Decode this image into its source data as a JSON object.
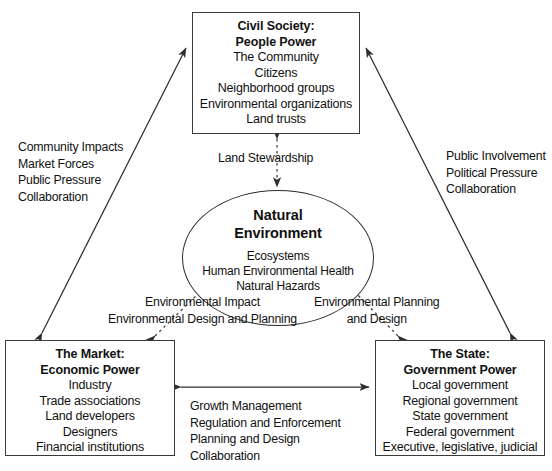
{
  "diagram": {
    "type": "relationship-triangle",
    "nodes": {
      "civil_society": {
        "title_line1": "Civil Society:",
        "title_line2": "People Power",
        "items": [
          "The Community",
          "Citizens",
          "Neighborhood groups",
          "Environmental organizations",
          "Land trusts"
        ]
      },
      "market": {
        "title_line1": "The Market:",
        "title_line2": "Economic Power",
        "items": [
          "Industry",
          "Trade associations",
          "Land developers",
          "Designers",
          "Financial institutions"
        ]
      },
      "state": {
        "title_line1": "The State:",
        "title_line2": "Government Power",
        "items": [
          "Local government",
          "Regional government",
          "State government",
          "Federal government",
          "Executive, legislative, judicial"
        ]
      },
      "natural_environment": {
        "title_line1": "Natural",
        "title_line2": "Environment",
        "items": [
          "Ecosystems",
          "Human Environmental Health",
          "Natural Hazards"
        ]
      }
    },
    "edge_labels": {
      "market_to_civil_society": [
        "Community Impacts",
        "Market Forces",
        "Public Pressure",
        "Collaboration"
      ],
      "state_to_civil_society": [
        "Public Involvement",
        "Political Pressure",
        "Collaboration"
      ],
      "civil_society_to_environment": [
        "Land Stewardship"
      ],
      "market_to_environment": [
        "Environmental Impact",
        "Environmental Design and Planning"
      ],
      "state_to_environment": [
        "Environmental Planning",
        "and Design"
      ],
      "market_to_state": [
        "Growth Management",
        "Regulation and Enforcement",
        "Planning and Design",
        "Collaboration"
      ]
    },
    "colors": {
      "stroke": "#3a3a3a",
      "text": "#111111",
      "background": "#ffffff"
    }
  }
}
